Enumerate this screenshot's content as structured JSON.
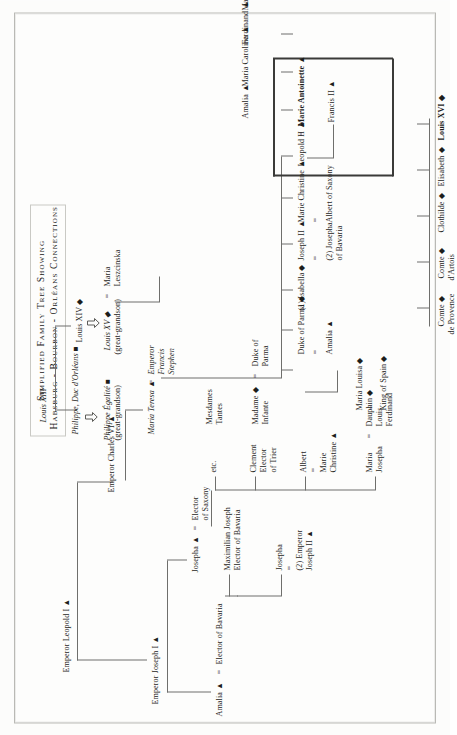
{
  "document": {
    "title_line_1": "Simplified Family Tree Showing",
    "title_line_2": "Habsburg - Bourbon - Orléans Connections",
    "orientation": "rotated-90-ccw",
    "symbols": {
      "habsburg": "▲",
      "bourbon": "◆",
      "orleans": "■",
      "descent": "⇩"
    }
  },
  "tree": {
    "generation_1": [
      {
        "id": "leopold1",
        "label": "Emperor Leopold I ▲",
        "style": "roman"
      },
      {
        "id": "charles6",
        "label": "Emperor Charles VI ▲",
        "style": "roman"
      },
      {
        "id": "joseph1",
        "label": "Emperor Joseph I ▲",
        "style": "roman"
      },
      {
        "id": "louis13",
        "label": "Louis XIII",
        "style": "italic"
      }
    ],
    "bourbon_line": [
      {
        "id": "louis14",
        "label": "Louis XIV ◆",
        "style": "roman"
      },
      {
        "id": "louis15",
        "label": "Louis XV ◆",
        "sub": "(great-grandson)",
        "style": "italic"
      },
      {
        "id": "maria_leszcinska",
        "eq": "=",
        "label": "Maria",
        "sub": "Leszcinska",
        "style": "roman"
      }
    ],
    "orleans_line": [
      {
        "id": "philippe_duc",
        "label": "Philippe, Duc d'Orléans ■",
        "style": "italic"
      },
      {
        "id": "philippe_egalite",
        "label": "Philippe Égalité ■",
        "sub": "(great-grandson)",
        "style": "italic"
      }
    ],
    "maria_teresa": {
      "id": "maria_teresa",
      "label": "Maria Teresa ▲",
      "eq": "=",
      "spouse_line_1": "Emperor",
      "spouse_line_2": "Francis",
      "spouse_line_3": "Stephen",
      "style": "italic"
    },
    "joseph1_children": [
      {
        "id": "amalia_bavaria",
        "label": "Amalia ▲",
        "eq": "=",
        "spouse": "Elector of Bavaria"
      },
      {
        "id": "josepha_saxony",
        "label": "Josepha ▲",
        "eq": "=",
        "spouse_line_1": "Elector",
        "spouse_line_2": "of Saxony"
      }
    ],
    "bavaria_children": [
      {
        "id": "maximilian_joseph",
        "line_1": "Maximilian Joseph",
        "line_2": "Elector of Bavaria"
      },
      {
        "id": "josepha_joseph2",
        "line_1": "Josepha",
        "eq": "=",
        "line_2": "(2) Emperor",
        "line_3": "Joseph II ▲"
      }
    ],
    "saxony_children": [
      {
        "id": "etc_saxony",
        "label": "etc."
      },
      {
        "id": "clement_trier",
        "line_1": "Clement",
        "line_2": "Elector",
        "line_3": "of Trier"
      },
      {
        "id": "albert_saxony",
        "line_1": "Albert",
        "eq": "=",
        "line_2": "Marie",
        "line_3": "Christine ▲"
      },
      {
        "id": "maria_josepha_dauphin",
        "line_1": "Maria",
        "line_2": "Josepha",
        "eq": "=",
        "spouse_1": "Dauphin ◆",
        "spouse_2": "Louis",
        "spouse_3": "Ferdinand"
      }
    ],
    "louis15_children": [
      {
        "id": "mesdames_tantes",
        "line_1": "Mesdames",
        "line_2": "Tantes"
      },
      {
        "id": "madame_infante",
        "line_1": "Madame ◆",
        "line_2": "Infante",
        "eq": "=",
        "spouse_1": "Duke of",
        "spouse_2": "Parma"
      }
    ],
    "maria_teresa_children": [
      {
        "id": "maria_louisa",
        "line_1": "Maria Louisa ◆",
        "eq": "=",
        "line_2": "King of Spain ◆"
      },
      {
        "id": "duke_parma_amalia",
        "line_1": "Duke of Parma ◆",
        "eq": "=",
        "line_2": "Amalia ▲"
      },
      {
        "id": "isabella_joseph2",
        "line_1": "(1) Isabella ◆",
        "eq": "=",
        "line_2": "Joseph II ▲",
        "line_3_eq": "=",
        "line_4": "(2) Josepha",
        "line_5": "of Bavaria"
      },
      {
        "id": "marie_christine_albert",
        "line_1": "Marie Christine ▲",
        "eq": "=",
        "line_2": "Albert of Saxony"
      },
      {
        "id": "leopold2",
        "line_1": "Leopold II ▲"
      },
      {
        "id": "marie_antoinette",
        "eq": "=",
        "line_1": "Marie Antoinette ▲",
        "bold": true
      },
      {
        "id": "amalia_mt",
        "line_1": "Amalia ▲"
      },
      {
        "id": "maria_carolina",
        "line_1": "Maria Carolina ▲"
      },
      {
        "id": "ferdinand_mt",
        "line_1": "Ferdinand ▲"
      },
      {
        "id": "max_mt",
        "line_1": "Max ▲"
      },
      {
        "id": "etc_mt",
        "line_1": "etc. ▲"
      }
    ],
    "leopold2_children": [
      {
        "id": "francis2",
        "line_1": "Francis II ▲"
      }
    ],
    "louis16_children": [
      {
        "id": "comte_provence",
        "line_1": "Comte ◆",
        "line_2": "de Provence"
      },
      {
        "id": "comte_artois",
        "line_1": "Comte ◆",
        "line_2": "d'Artois"
      },
      {
        "id": "clothilde",
        "line_1": "Clothilde ◆"
      },
      {
        "id": "elisabeth",
        "line_1": "Elisabeth ◆"
      },
      {
        "id": "louis16",
        "line_1": "Louis XVI ◆",
        "bold": true
      }
    ]
  }
}
